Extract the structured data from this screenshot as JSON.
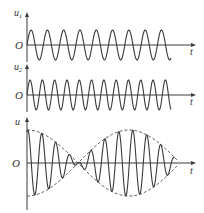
{
  "figure": {
    "colors": {
      "stroke": "#3a3a3a",
      "dash": "#555555",
      "text": "#333333",
      "background": "#ffffff"
    },
    "panels": [
      {
        "id": "u1",
        "y_label": "u",
        "y_label_sub": "1",
        "origin_label": "O",
        "x_label": "t",
        "axis_y": 45,
        "axis_top": 12,
        "axis_bottom": 62,
        "wave": {
          "type": "sine",
          "amplitude": 15,
          "period": 16.3,
          "x_start": 27,
          "x_end": 171
        }
      },
      {
        "id": "u2",
        "y_label": "u",
        "y_label_sub": "2",
        "origin_label": "O",
        "x_label": "t",
        "axis_y": 95,
        "axis_top": 64,
        "axis_bottom": 112,
        "wave": {
          "type": "sine",
          "amplitude": 15,
          "period": 12.3,
          "x_start": 27,
          "x_end": 171
        }
      },
      {
        "id": "u_sum",
        "y_label": "u",
        "y_label_sub": "",
        "origin_label": "O",
        "x_label": "t",
        "axis_y": 163,
        "axis_top": 117,
        "axis_bottom": 210,
        "wave": {
          "type": "beat",
          "amplitude": 33,
          "carrier_period": 14,
          "envelope_period": 166,
          "x_start": 27,
          "x_end": 175
        },
        "envelope": {
          "style": "dashed",
          "node_x": [
            78,
            160
          ]
        }
      }
    ],
    "axis_x_start": 27,
    "axis_x_end": 196
  }
}
